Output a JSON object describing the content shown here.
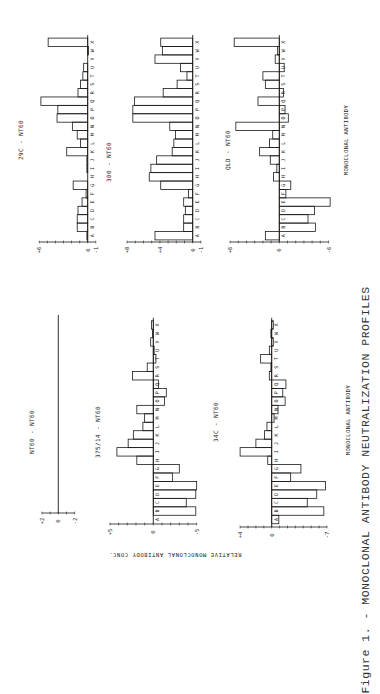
{
  "figure": {
    "caption": "Figure 1. - MONOCLONAL ANTIBODY NEUTRALIZATION PROFILES",
    "y_axis_label": "RELATIVE MONOCLONAL ANTIBODY CONC.",
    "x_axis_label_top": "MONOCLONAL ANTIBODY",
    "x_axis_label_bottom": "MONOCLONAL ANTIBODY",
    "bar_stroke": "#1a1a1a"
  },
  "chart_data": [
    {
      "type": "bar",
      "title": "29C - NT60",
      "xlabel": "MONOCLONAL ANTIBODY",
      "ylabel": "RELATIVE MONOCLONAL ANTIBODY CONC.",
      "categories": [
        "A",
        "B",
        "C",
        "D",
        "E",
        "F",
        "G",
        "H",
        "I",
        "J",
        "K",
        "L",
        "M",
        "N",
        "O",
        "P",
        "Q",
        "R",
        "S",
        "T",
        "U",
        "V",
        "W",
        "X"
      ],
      "values": [
        0.1,
        1.3,
        1.3,
        1.2,
        0.7,
        0.2,
        1.8,
        0,
        0.1,
        0.1,
        2.6,
        0.9,
        1.3,
        1.9,
        3.8,
        3.7,
        5.8,
        1.2,
        0.9,
        0.6,
        0.5,
        0,
        -0.1,
        4.9
      ],
      "ylim": [
        -1,
        6
      ],
      "tick_labels": [
        "+6",
        "0",
        "-1"
      ]
    },
    {
      "type": "bar",
      "title": "300 - NT60",
      "xlabel": "MONOCLONAL ANTIBODY",
      "ylabel": "RELATIVE MONOCLONAL ANTIBODY CONC.",
      "categories": [
        "A",
        "B",
        "C",
        "D",
        "E",
        "F",
        "G",
        "H",
        "I",
        "J",
        "K",
        "L",
        "M",
        "N",
        "O",
        "P",
        "Q",
        "R",
        "S",
        "T",
        "U",
        "V",
        "W",
        "X"
      ],
      "values": [
        4.6,
        1.1,
        1.1,
        0.9,
        1.1,
        0.5,
        3.9,
        5.3,
        5.1,
        4.4,
        2.5,
        2.3,
        2.1,
        2.8,
        7.3,
        7.3,
        7.1,
        3.6,
        1.9,
        0.7,
        1.5,
        4.6,
        3.7,
        3.9
      ],
      "ylim": [
        -1,
        8
      ],
      "tick_labels": [
        "+8",
        "+4",
        "0",
        "-1"
      ]
    },
    {
      "type": "bar",
      "title": "QLD - NT60",
      "xlabel": "MONOCLONAL ANTIBODY",
      "ylabel": "RELATIVE MONOCLONAL ANTIBODY CONC.",
      "categories": [
        "A",
        "B",
        "C",
        "D",
        "E",
        "F",
        "G",
        "H",
        "I",
        "J",
        "K",
        "L",
        "M",
        "N",
        "O",
        "P",
        "Q",
        "R",
        "S",
        "T",
        "U",
        "V",
        "W",
        "X"
      ],
      "values": [
        1.7,
        -4.4,
        -3.5,
        -4.3,
        -6.2,
        -0.8,
        -1.4,
        0.7,
        0.3,
        1.1,
        2.4,
        1.2,
        0.8,
        5.3,
        -1.1,
        -0.7,
        2.6,
        -0.5,
        1.7,
        2.0,
        -0.6,
        0.5,
        0.2,
        5.5
      ],
      "ylim": [
        -6,
        6
      ],
      "tick_labels": [
        "+6",
        "0",
        "-6"
      ]
    },
    {
      "type": "bar",
      "title": "NT60 - NT60",
      "xlabel": "MONOCLONAL ANTIBODY",
      "ylabel": "RELATIVE MONOCLONAL ANTIBODY CONC.",
      "categories": [
        "A",
        "B",
        "C",
        "D",
        "E",
        "F",
        "G",
        "H",
        "I",
        "J",
        "K",
        "L",
        "M",
        "N",
        "O",
        "P",
        "Q",
        "R",
        "S",
        "T",
        "U",
        "V",
        "W",
        "X"
      ],
      "values": [
        0,
        0,
        0,
        0,
        0,
        0,
        0,
        0,
        0,
        0,
        0,
        0,
        0,
        0,
        0,
        0,
        0,
        0,
        0,
        0,
        0,
        0,
        0,
        0
      ],
      "ylim": [
        -2,
        2
      ],
      "tick_labels": [
        "+2",
        "0",
        "-2"
      ]
    },
    {
      "type": "bar",
      "title": "375/14 - NT60",
      "xlabel": "MONOCLONAL ANTIBODY",
      "ylabel": "RELATIVE MONOCLONAL ANTIBODY CONC.",
      "categories": [
        "A",
        "B",
        "C",
        "D",
        "E",
        "F",
        "G",
        "H",
        "I",
        "J",
        "K",
        "L",
        "M",
        "N",
        "O",
        "P",
        "Q",
        "R",
        "S",
        "T",
        "U",
        "V",
        "W",
        "X"
      ],
      "values": [
        0,
        -4.9,
        -3.8,
        -4.9,
        -5.0,
        -2.2,
        -3.0,
        1.9,
        4.2,
        2.9,
        2.3,
        1.2,
        1.0,
        1.9,
        -1.3,
        -1.5,
        -0.6,
        2.4,
        0.7,
        -0.3,
        -0.1,
        0.3,
        0.1,
        0.2
      ],
      "ylim": [
        -5,
        5
      ],
      "tick_labels": [
        "+5",
        "0",
        "-5"
      ]
    },
    {
      "type": "bar",
      "title": "34C - NT60",
      "xlabel": "MONOCLONAL ANTIBODY",
      "ylabel": "RELATIVE MONOCLONAL ANTIBODY CONC.",
      "categories": [
        "A",
        "B",
        "C",
        "D",
        "E",
        "F",
        "G",
        "H",
        "I",
        "J",
        "K",
        "L",
        "M",
        "N",
        "O",
        "P",
        "Q",
        "R",
        "S",
        "T",
        "U",
        "V",
        "W",
        "X"
      ],
      "values": [
        -0.9,
        -6.6,
        -4.5,
        -5.7,
        -6.8,
        -2.4,
        -3.7,
        0.5,
        4.0,
        2.0,
        0.9,
        0.6,
        -0.3,
        -0.8,
        -1.7,
        -1.4,
        -1.8,
        0.3,
        0.1,
        1.4,
        0.3,
        -0.2,
        0.1,
        -0.2
      ],
      "ylim": [
        -7,
        4
      ],
      "tick_labels": [
        "+4",
        "0",
        "-7"
      ]
    }
  ]
}
